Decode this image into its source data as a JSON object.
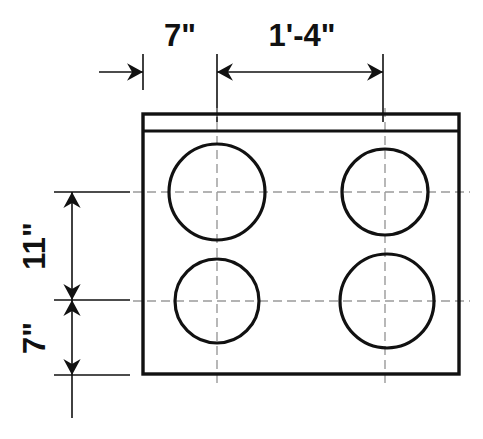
{
  "drawing": {
    "title": "Plan view of rectangular block with four circular holes",
    "units": "feet-inches",
    "line_color": "#111111",
    "center_line_color": "#9a9a9a",
    "background_color": "#ffffff",
    "dimensions": {
      "top": {
        "orientation": "horizontal",
        "segments": [
          {
            "label": "7\"",
            "from_x": 143,
            "to_x": 217,
            "text_x": 180,
            "text_y": 46
          },
          {
            "label": "1'-4\"",
            "from_x": 217,
            "to_x": 383,
            "text_x": 302,
            "text_y": 46
          }
        ],
        "dim_line_y": 72,
        "extension_lines_x": [
          143,
          217,
          383
        ]
      },
      "left": {
        "orientation": "vertical",
        "segments": [
          {
            "label": "11\"",
            "from_y": 192,
            "to_y": 300,
            "text_x": 45,
            "text_y": 246
          },
          {
            "label": "7\"",
            "from_y": 300,
            "to_y": 375,
            "text_x": 45,
            "text_y": 338
          }
        ],
        "dim_line_x": 72,
        "extension_lines_y": [
          192,
          300,
          375
        ]
      }
    },
    "body": {
      "outline": {
        "x": 143,
        "y": 114,
        "width": 316,
        "height": 260
      },
      "ledge_line_y": 130
    },
    "holes": [
      {
        "name": "hole-top-left",
        "cx": 217,
        "cy": 192,
        "r": 48
      },
      {
        "name": "hole-top-right",
        "cx": 385,
        "cy": 192,
        "r": 43
      },
      {
        "name": "hole-bottom-left",
        "cx": 217,
        "cy": 301,
        "r": 42
      },
      {
        "name": "hole-bottom-right",
        "cx": 387,
        "cy": 301,
        "r": 47
      }
    ],
    "center_lines": {
      "vertical_x": [
        217,
        385
      ],
      "vertical_from_y": 108,
      "vertical_to_y": 384,
      "horizontal_y": [
        192,
        301
      ],
      "horizontal_from_x": 133,
      "horizontal_to_x": 470
    }
  }
}
